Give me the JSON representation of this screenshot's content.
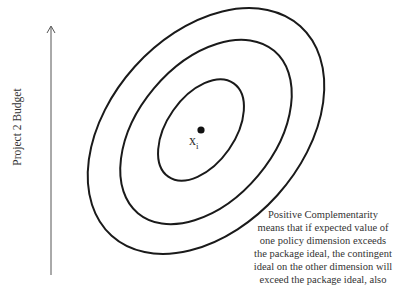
{
  "diagram": {
    "y_axis_label": "Project 2 Budget",
    "point": {
      "label": "x",
      "subscript": "i"
    },
    "ellipses": [
      {
        "name": "inner",
        "cx": 201,
        "cy": 130,
        "rx": 57,
        "ry": 34,
        "rotate": -55
      },
      {
        "name": "middle",
        "cx": 206,
        "cy": 132,
        "rx": 106,
        "ry": 68,
        "rotate": -50
      },
      {
        "name": "outer",
        "cx": 206,
        "cy": 131,
        "rx": 141,
        "ry": 96,
        "rotate": -48
      }
    ],
    "annotation_lines": [
      "Positive Complementarity",
      "means that if expected value of",
      "one policy dimension exceeds",
      "the package ideal, the contingent",
      "ideal on the other dimension will",
      "exceed the package ideal, also"
    ],
    "colors": {
      "stroke": "#1a1a1a",
      "text": "#333333",
      "axis": "#555555"
    }
  }
}
